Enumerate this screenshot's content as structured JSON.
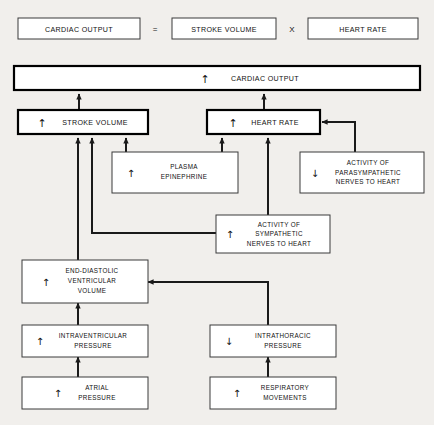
{
  "equation": {
    "output_label": "CARDIAC OUTPUT",
    "equals_sign": "=",
    "stroke_volume_label": "STROKE VOLUME",
    "times_sign": "X",
    "heart_rate_label": "HEART RATE"
  },
  "nodes": {
    "cardiac_output": {
      "arrow": "↑",
      "label": "CARDIAC OUTPUT"
    },
    "stroke_volume": {
      "arrow": "↑",
      "label": "STROKE VOLUME"
    },
    "heart_rate": {
      "arrow": "↑",
      "label": "HEART RATE"
    },
    "plasma_epinephrine": {
      "arrow": "↑",
      "line1": "PLASMA",
      "line2": "EPINEPHRINE"
    },
    "parasympathetic": {
      "arrow": "↓",
      "line1": "ACTIVITY OF",
      "line2": "PARASYMPATHETIC",
      "line3": "NERVES TO HEART"
    },
    "sympathetic": {
      "arrow": "↑",
      "line1": "ACTIVITY OF",
      "line2": "SYMPATHETIC",
      "line3": "NERVES TO HEART"
    },
    "end_diastolic": {
      "arrow": "↑",
      "line1": "END-DIASTOLIC",
      "line2": "VENTRICULAR",
      "line3": "VOLUME"
    },
    "intraventricular": {
      "arrow": "↑",
      "line1": "INTRAVENTRICULAR",
      "line2": "PRESSURE"
    },
    "intrathoracic": {
      "arrow": "↓",
      "line1": "INTRATHORACIC",
      "line2": "PRESSURE"
    },
    "atrial_pressure": {
      "arrow": "↑",
      "line1": "ATRIAL",
      "line2": "PRESSURE"
    },
    "respiratory": {
      "arrow": "↑",
      "line1": "RESPIRATORY",
      "line2": "MOVEMENTS"
    }
  },
  "colors": {
    "background": "#f1efec",
    "box_fill": "#ffffff",
    "box_stroke": "#3a3a3a",
    "emphasis_stroke": "#000000",
    "connector": "#1a1a1a",
    "text": "#111111"
  }
}
